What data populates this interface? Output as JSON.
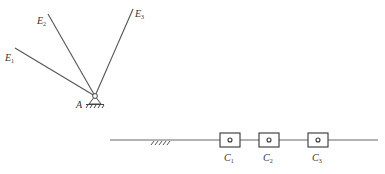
{
  "diagram": {
    "linkage": {
      "pivot": {
        "label": "A",
        "x": 95,
        "y": 96
      },
      "arms": [
        {
          "label": "E",
          "sub": "1",
          "x": 15,
          "y": 48
        },
        {
          "label": "E",
          "sub": "2",
          "x": 48,
          "y": 14
        },
        {
          "label": "E",
          "sub": "3",
          "x": 133,
          "y": 9
        }
      ]
    },
    "slider_track": {
      "x_start": 110,
      "x_end": 378,
      "y": 140,
      "ground_hatch": {
        "x_start": 150,
        "x_end": 172
      },
      "sliders": [
        {
          "label": "C",
          "sub": "1",
          "x": 230
        },
        {
          "label": "C",
          "sub": "2",
          "x": 269
        },
        {
          "label": "C",
          "sub": "3",
          "x": 318
        }
      ]
    },
    "colors": {
      "line": "#555555",
      "text": "#333333"
    }
  }
}
